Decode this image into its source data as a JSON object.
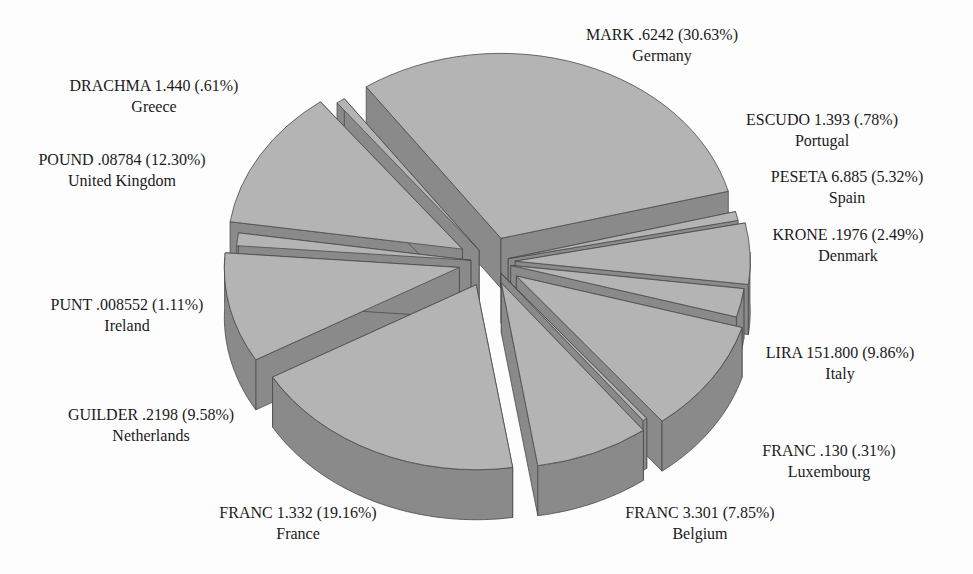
{
  "chart_data": {
    "type": "pie",
    "style": "3d-exploded",
    "title": "",
    "colors": {
      "top": "#b4b4b4",
      "side": "#8a8a8a",
      "edge": "#4a4a4a",
      "background": "#fdfdfd"
    },
    "slices": [
      {
        "currency": "MARK",
        "rate": ".6242",
        "percent": 30.63,
        "percent_label": "30.63%",
        "country": "Germany",
        "line1": "MARK .6242 (30.63%)",
        "lx": 662,
        "ly": 36
      },
      {
        "currency": "ESCUDO",
        "rate": "1.393",
        "percent": 0.78,
        "percent_label": ".78%",
        "country": "Portugal",
        "line1": "ESCUDO 1.393 (.78%)",
        "lx": 822,
        "ly": 121
      },
      {
        "currency": "PESETA",
        "rate": "6.885",
        "percent": 5.32,
        "percent_label": "5.32%",
        "country": "Spain",
        "line1": "PESETA 6.885 (5.32%)",
        "lx": 847,
        "ly": 178
      },
      {
        "currency": "KRONE",
        "rate": ".1976",
        "percent": 2.49,
        "percent_label": "2.49%",
        "country": "Denmark",
        "line1": "KRONE .1976 (2.49%)",
        "lx": 848,
        "ly": 236
      },
      {
        "currency": "LIRA",
        "rate": "151.800",
        "percent": 9.86,
        "percent_label": "9.86%",
        "country": "Italy",
        "line1": "LIRA 151.800 (9.86%)",
        "lx": 840,
        "ly": 354
      },
      {
        "currency": "FRANC",
        "rate": ".130",
        "percent": 0.31,
        "percent_label": ".31%",
        "country": "Luxembourg",
        "line1": "FRANC .130 (.31%)",
        "lx": 829,
        "ly": 452
      },
      {
        "currency": "FRANC",
        "rate": "3.301",
        "percent": 7.85,
        "percent_label": "7.85%",
        "country": "Belgium",
        "line1": "FRANC 3.301 (7.85%)",
        "lx": 700,
        "ly": 514
      },
      {
        "currency": "FRANC",
        "rate": "1.332",
        "percent": 19.16,
        "percent_label": "19.16%",
        "country": "France",
        "line1": "FRANC 1.332 (19.16%)",
        "lx": 298,
        "ly": 514
      },
      {
        "currency": "GUILDER",
        "rate": ".2198",
        "percent": 9.58,
        "percent_label": "9.58%",
        "country": "Netherlands",
        "line1": "GUILDER .2198 (9.58%)",
        "lx": 151,
        "ly": 416
      },
      {
        "currency": "PUNT",
        "rate": ".008552",
        "percent": 1.11,
        "percent_label": "1.11%",
        "country": "Ireland",
        "line1": "PUNT .008552 (1.11%)",
        "lx": 127,
        "ly": 306
      },
      {
        "currency": "POUND",
        "rate": ".08784",
        "percent": 12.3,
        "percent_label": "12.30%",
        "country": "United Kingdom",
        "line1": "POUND .08784 (12.30%)",
        "lx": 122,
        "ly": 161
      },
      {
        "currency": "DRACHMA",
        "rate": "1.440",
        "percent": 0.61,
        "percent_label": ".61%",
        "country": "Greece",
        "line1": "DRACHMA 1.440 (.61%)",
        "lx": 154,
        "ly": 87
      }
    ],
    "geometry": {
      "cx": 490,
      "cy": 262,
      "rx": 235,
      "ry": 185,
      "depth": 50,
      "start_deg": -125,
      "explode": 32
    }
  }
}
